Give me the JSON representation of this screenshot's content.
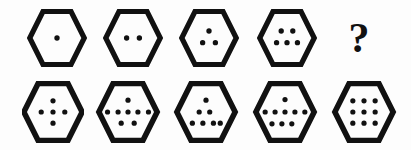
{
  "puzzle": {
    "type": "visual-sequence-reasoning",
    "background_color": "#fdfdfd",
    "ink_color": "#111111",
    "shape": "hexagon",
    "missing_marker": "?",
    "sequence": {
      "name": "top-row-sequence",
      "items": [
        {
          "id": "seq-1",
          "position": 1,
          "shape": "hexagon",
          "dot_count": 1,
          "arrangement": "single-center",
          "dots": [
            {
              "x": 50,
              "y": 50
            }
          ]
        },
        {
          "id": "seq-2",
          "position": 2,
          "shape": "hexagon",
          "dot_count": 2,
          "arrangement": "horizontal-pair",
          "dots": [
            {
              "x": 39,
              "y": 50
            },
            {
              "x": 61,
              "y": 50
            }
          ]
        },
        {
          "id": "seq-3",
          "position": 3,
          "shape": "hexagon",
          "dot_count": 3,
          "arrangement": "triangle-1-2",
          "dots": [
            {
              "x": 50,
              "y": 38
            },
            {
              "x": 39,
              "y": 58
            },
            {
              "x": 61,
              "y": 58
            }
          ]
        },
        {
          "id": "seq-4",
          "position": 4,
          "shape": "hexagon",
          "dot_count": 5,
          "arrangement": "rows-2-3",
          "dots": [
            {
              "x": 40,
              "y": 38
            },
            {
              "x": 60,
              "y": 38
            },
            {
              "x": 32,
              "y": 58
            },
            {
              "x": 50,
              "y": 58
            },
            {
              "x": 68,
              "y": 58
            }
          ]
        },
        {
          "id": "seq-5",
          "position": 5,
          "shape": "question-mark",
          "label": "?",
          "dot_count": null,
          "arrangement": "unknown",
          "dots": []
        }
      ]
    },
    "options": {
      "name": "bottom-row-options",
      "items": [
        {
          "id": "option-1",
          "label": "1",
          "shape": "hexagon",
          "dot_count": 5,
          "arrangement": "cross-1-3-1",
          "dots": [
            {
              "x": 50,
              "y": 32
            },
            {
              "x": 31,
              "y": 50
            },
            {
              "x": 50,
              "y": 50
            },
            {
              "x": 69,
              "y": 50
            },
            {
              "x": 50,
              "y": 68
            }
          ]
        },
        {
          "id": "option-2",
          "label": "2",
          "shape": "hexagon",
          "dot_count": 8,
          "arrangement": "rows-1-5-2",
          "dots": [
            {
              "x": 50,
              "y": 31
            },
            {
              "x": 17,
              "y": 50
            },
            {
              "x": 34,
              "y": 50
            },
            {
              "x": 50,
              "y": 50
            },
            {
              "x": 66,
              "y": 50
            },
            {
              "x": 83,
              "y": 50
            },
            {
              "x": 39,
              "y": 68
            },
            {
              "x": 60,
              "y": 68
            }
          ]
        },
        {
          "id": "option-3",
          "label": "3",
          "shape": "hexagon",
          "dot_count": 7,
          "arrangement": "pyramid-1-3-3",
          "dots": [
            {
              "x": 50,
              "y": 31
            },
            {
              "x": 39,
              "y": 50
            },
            {
              "x": 56,
              "y": 50
            },
            {
              "x": 28,
              "y": 68
            },
            {
              "x": 45,
              "y": 68
            },
            {
              "x": 62,
              "y": 68
            },
            {
              "x": 73,
              "y": 68
            }
          ]
        },
        {
          "id": "option-4",
          "label": "4",
          "shape": "hexagon",
          "dot_count": 9,
          "arrangement": "rows-1-5-3",
          "dots": [
            {
              "x": 50,
              "y": 30
            },
            {
              "x": 18,
              "y": 50
            },
            {
              "x": 34,
              "y": 50
            },
            {
              "x": 50,
              "y": 50
            },
            {
              "x": 66,
              "y": 50
            },
            {
              "x": 82,
              "y": 50
            },
            {
              "x": 29,
              "y": 69
            },
            {
              "x": 45,
              "y": 69
            },
            {
              "x": 61,
              "y": 69
            }
          ]
        },
        {
          "id": "option-5",
          "label": "5",
          "shape": "hexagon",
          "dot_count": 9,
          "arrangement": "grid-3x3",
          "dots": [
            {
              "x": 32,
              "y": 32
            },
            {
              "x": 50,
              "y": 32
            },
            {
              "x": 68,
              "y": 32
            },
            {
              "x": 32,
              "y": 50
            },
            {
              "x": 50,
              "y": 50
            },
            {
              "x": 68,
              "y": 50
            },
            {
              "x": 32,
              "y": 68
            },
            {
              "x": 50,
              "y": 68
            },
            {
              "x": 68,
              "y": 68
            }
          ]
        }
      ]
    }
  }
}
